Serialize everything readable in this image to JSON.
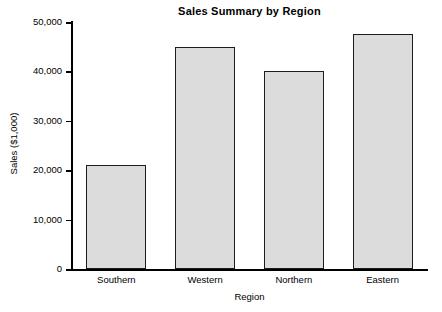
{
  "chart_data": {
    "type": "bar",
    "title": "Sales Summary by Region",
    "xlabel": "Region",
    "ylabel": "Sales ($1,000)",
    "categories": [
      "Southern",
      "Western",
      "Northern",
      "Eastern"
    ],
    "values": [
      21000,
      45000,
      40000,
      47500
    ],
    "ylim": [
      0,
      50000
    ],
    "ytick_values": [
      0,
      10000,
      20000,
      30000,
      40000,
      50000
    ],
    "ytick_labels": [
      "0",
      "10,000",
      "20,000",
      "30,000",
      "40,000",
      "50,000"
    ],
    "grid": false,
    "legend": null,
    "bar_fill_color": "#dcdcdc",
    "bar_edge_color": "#1c1c1c",
    "background_color": "#ffffff",
    "axis_color": "#000000"
  }
}
